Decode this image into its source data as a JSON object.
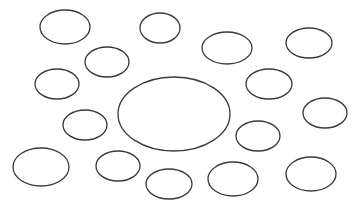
{
  "diagram": {
    "width": 361,
    "height": 207,
    "background": "#ffffff",
    "stroke_color": "#3a3a3a",
    "central_ellipse": {
      "cx": 174,
      "cy": 114,
      "rx": 56,
      "ry": 37
    },
    "ellipses": [
      {
        "cx": 65,
        "cy": 27,
        "rx": 25,
        "ry": 17
      },
      {
        "cx": 160,
        "cy": 28,
        "rx": 20,
        "ry": 15
      },
      {
        "cx": 227,
        "cy": 48,
        "rx": 25,
        "ry": 16
      },
      {
        "cx": 309,
        "cy": 43,
        "rx": 23,
        "ry": 15
      },
      {
        "cx": 107,
        "cy": 62,
        "rx": 22,
        "ry": 15
      },
      {
        "cx": 57,
        "cy": 84,
        "rx": 22,
        "ry": 15
      },
      {
        "cx": 269,
        "cy": 84,
        "rx": 23,
        "ry": 15
      },
      {
        "cx": 325,
        "cy": 113,
        "rx": 22,
        "ry": 15
      },
      {
        "cx": 85,
        "cy": 125,
        "rx": 22,
        "ry": 15
      },
      {
        "cx": 258,
        "cy": 136,
        "rx": 22,
        "ry": 15
      },
      {
        "cx": 41,
        "cy": 167,
        "rx": 28,
        "ry": 19
      },
      {
        "cx": 118,
        "cy": 166,
        "rx": 22,
        "ry": 15
      },
      {
        "cx": 169,
        "cy": 184,
        "rx": 23,
        "ry": 15
      },
      {
        "cx": 233,
        "cy": 179,
        "rx": 25,
        "ry": 17
      },
      {
        "cx": 311,
        "cy": 174,
        "rx": 25,
        "ry": 17
      }
    ]
  }
}
